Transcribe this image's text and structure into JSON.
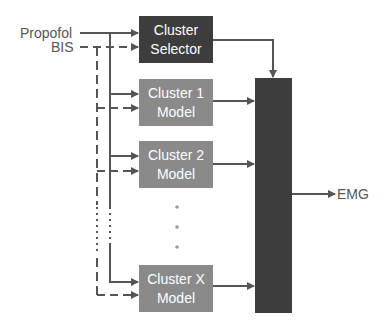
{
  "diagram": {
    "inputs": [
      {
        "id": "propofol",
        "label": "Propofol",
        "line_style": "solid"
      },
      {
        "id": "bis",
        "label": "BIS",
        "line_style": "dashed"
      }
    ],
    "selector": {
      "line1": "Cluster",
      "line2": "Selector",
      "color": "#3d3d3d"
    },
    "models": [
      {
        "line1": "Cluster 1",
        "line2": "Model"
      },
      {
        "line1": "Cluster 2",
        "line2": "Model"
      },
      {
        "line1": "Cluster X",
        "line2": "Model"
      }
    ],
    "model_color": "#8a8a8a",
    "ellipsis": "⋮",
    "switch_block": {
      "color": "#3d3d3d",
      "label": ""
    },
    "output": {
      "label": "EMG"
    },
    "line_color": "#555555"
  }
}
